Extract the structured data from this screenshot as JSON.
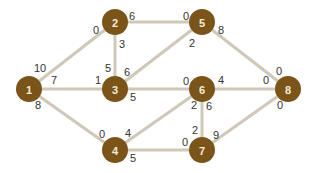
{
  "diagram": {
    "type": "weighted-graph",
    "colors": {
      "node_fill": "#7a5418",
      "node_text": "#f4ecd8",
      "edge": "#cfc8b8",
      "label": "#333333"
    },
    "nodes": [
      {
        "id": "1",
        "label": "1",
        "x": 29,
        "y": 89
      },
      {
        "id": "2",
        "label": "2",
        "x": 115,
        "y": 22
      },
      {
        "id": "3",
        "label": "3",
        "x": 115,
        "y": 89
      },
      {
        "id": "4",
        "label": "4",
        "x": 115,
        "y": 150
      },
      {
        "id": "5",
        "label": "5",
        "x": 202,
        "y": 22
      },
      {
        "id": "6",
        "label": "6",
        "x": 202,
        "y": 89
      },
      {
        "id": "7",
        "label": "7",
        "x": 202,
        "y": 150
      },
      {
        "id": "8",
        "label": "8",
        "x": 288,
        "y": 89
      }
    ],
    "edges": [
      {
        "from": "1",
        "to": "2",
        "labels": [
          {
            "text": "10",
            "x": 40,
            "y": 68
          },
          {
            "text": "0",
            "x": 96,
            "y": 30
          }
        ]
      },
      {
        "from": "1",
        "to": "3",
        "labels": [
          {
            "text": "7",
            "x": 54,
            "y": 80
          },
          {
            "text": "1",
            "x": 98,
            "y": 80
          }
        ]
      },
      {
        "from": "1",
        "to": "4",
        "labels": [
          {
            "text": "8",
            "x": 38,
            "y": 105
          },
          {
            "text": "0",
            "x": 102,
            "y": 134
          }
        ]
      },
      {
        "from": "2",
        "to": "3",
        "labels": [
          {
            "text": "3",
            "x": 122,
            "y": 44
          },
          {
            "text": "5",
            "x": 108,
            "y": 68
          }
        ]
      },
      {
        "from": "2",
        "to": "5",
        "labels": [
          {
            "text": "6",
            "x": 132,
            "y": 16
          },
          {
            "text": "0",
            "x": 186,
            "y": 16
          }
        ]
      },
      {
        "from": "3",
        "to": "5",
        "labels": [
          {
            "text": "6",
            "x": 127,
            "y": 72
          },
          {
            "text": "2",
            "x": 192,
            "y": 43
          }
        ]
      },
      {
        "from": "3",
        "to": "6",
        "labels": [
          {
            "text": "5",
            "x": 133,
            "y": 97
          },
          {
            "text": "0",
            "x": 186,
            "y": 81
          }
        ]
      },
      {
        "from": "4",
        "to": "6",
        "labels": [
          {
            "text": "4",
            "x": 128,
            "y": 133
          },
          {
            "text": "2",
            "x": 194,
            "y": 105
          }
        ]
      },
      {
        "from": "4",
        "to": "7",
        "labels": [
          {
            "text": "5",
            "x": 133,
            "y": 158
          },
          {
            "text": "0",
            "x": 185,
            "y": 142
          }
        ]
      },
      {
        "from": "5",
        "to": "8",
        "labels": [
          {
            "text": "8",
            "x": 221,
            "y": 30
          },
          {
            "text": "0",
            "x": 279,
            "y": 71
          }
        ]
      },
      {
        "from": "6",
        "to": "8",
        "labels": [
          {
            "text": "4",
            "x": 221,
            "y": 80
          },
          {
            "text": "0",
            "x": 266,
            "y": 80
          }
        ]
      },
      {
        "from": "6",
        "to": "7",
        "labels": [
          {
            "text": "6",
            "x": 209,
            "y": 106
          },
          {
            "text": "2",
            "x": 195,
            "y": 130
          }
        ]
      },
      {
        "from": "7",
        "to": "8",
        "labels": [
          {
            "text": "9",
            "x": 216,
            "y": 135
          },
          {
            "text": "0",
            "x": 280,
            "y": 105
          }
        ]
      }
    ]
  }
}
